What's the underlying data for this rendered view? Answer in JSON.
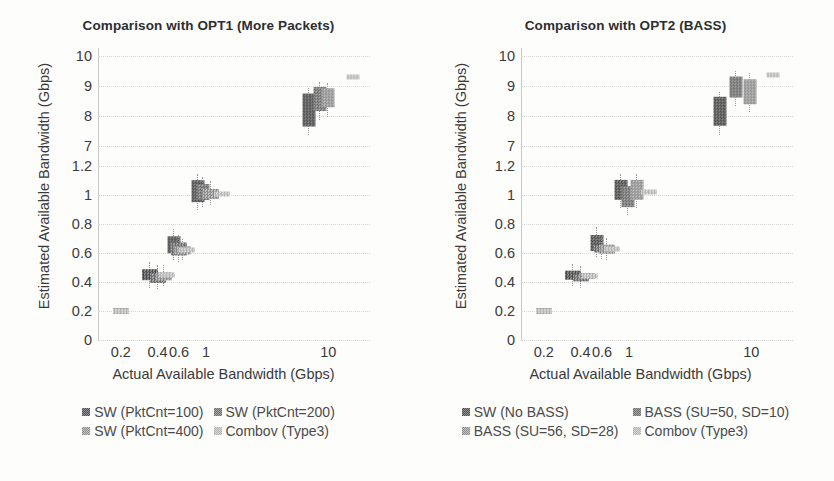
{
  "figure": {
    "background": "#fdfdfc",
    "axis_color": "#c9c9c9",
    "text_color": "#3a3a3a"
  },
  "chart_data": [
    {
      "id": "left",
      "type": "scatter",
      "title": "Comparison with OPT1 (More Packets)",
      "xlabel": "Actual Available Bandwidth (Gbps)",
      "ylabel": "Estimated Available Bandwidth (Gbps)",
      "x_scale": "log",
      "xticks": [
        "0.2",
        "0.4",
        "0.6",
        "1",
        "10"
      ],
      "xtick_values": [
        0.2,
        0.4,
        0.6,
        1,
        10
      ],
      "yticks": [
        "0",
        "0.2",
        "0.4",
        "0.6",
        "0.8",
        "1",
        "1.2",
        "7",
        "8",
        "9",
        "10"
      ],
      "ytick_values": [
        0,
        0.2,
        0.4,
        0.6,
        0.8,
        1,
        1.2,
        7,
        8,
        9,
        10
      ],
      "y_axis_break": "between 1.2 and 7",
      "grid": true,
      "legend_position": "bottom",
      "series": [
        {
          "name": "SW (PktCnt=100)",
          "color": "#4a4a4a",
          "x": [
            0.2,
            0.35,
            0.55,
            0.85,
            7.0
          ],
          "y": [
            0.2,
            0.45,
            0.66,
            1.03,
            8.2
          ],
          "y_low": [
            0.2,
            0.41,
            0.6,
            0.95,
            7.6
          ],
          "y_high": [
            0.2,
            0.49,
            0.72,
            1.1,
            8.7
          ]
        },
        {
          "name": "SW (PktCnt=200)",
          "color": "#6a6a6a",
          "x": [
            0.2,
            0.4,
            0.6,
            0.95,
            8.5
          ],
          "y": [
            0.2,
            0.43,
            0.63,
            1.02,
            8.55
          ],
          "y_low": [
            0.2,
            0.4,
            0.59,
            0.97,
            8.1
          ],
          "y_high": [
            0.2,
            0.47,
            0.68,
            1.08,
            8.9
          ]
        },
        {
          "name": "SW (PktCnt=400)",
          "color": "#8c8c8c",
          "x": [
            0.2,
            0.45,
            0.65,
            1.1,
            10.0
          ],
          "y": [
            0.2,
            0.44,
            0.62,
            1.01,
            8.6
          ],
          "y_low": [
            0.2,
            0.42,
            0.6,
            0.98,
            8.2
          ],
          "y_high": [
            0.2,
            0.47,
            0.65,
            1.05,
            8.85
          ]
        },
        {
          "name": "Combov (Type3)",
          "color": "#b4b4b4",
          "x": [
            0.2,
            0.48,
            0.7,
            1.35,
            16.0
          ],
          "y": [
            0.2,
            0.45,
            0.62,
            1.01,
            9.3
          ],
          "y_low": [
            0.2,
            0.44,
            0.61,
            1.0,
            9.25
          ],
          "y_high": [
            0.2,
            0.46,
            0.63,
            1.02,
            9.35
          ]
        }
      ]
    },
    {
      "id": "right",
      "type": "scatter",
      "title": "Comparison with OPT2 (BASS)",
      "xlabel": "Actual Available Bandwidth (Gbps)",
      "ylabel": "Estimated Available Bandwidth (Gbps)",
      "x_scale": "log",
      "xticks": [
        "0.2",
        "0.4",
        "0.6",
        "1",
        "10"
      ],
      "xtick_values": [
        0.2,
        0.4,
        0.6,
        1,
        10
      ],
      "yticks": [
        "0",
        "0.2",
        "0.4",
        "0.6",
        "0.8",
        "1",
        "1.2",
        "7",
        "8",
        "9",
        "10"
      ],
      "ytick_values": [
        0,
        0.2,
        0.4,
        0.6,
        0.8,
        1,
        1.2,
        7,
        8,
        9,
        10
      ],
      "y_axis_break": "between 1.2 and 7",
      "grid": true,
      "legend_position": "bottom",
      "series": [
        {
          "name": "SW (No BASS)",
          "color": "#4a4a4a",
          "x": [
            0.2,
            0.35,
            0.55,
            0.85,
            5.5
          ],
          "y": [
            0.2,
            0.45,
            0.67,
            1.04,
            8.15
          ],
          "y_low": [
            0.2,
            0.42,
            0.62,
            0.96,
            7.6
          ],
          "y_high": [
            0.2,
            0.48,
            0.73,
            1.1,
            8.55
          ]
        },
        {
          "name": "BASS (SU=50, SD=10)",
          "color": "#6a6a6a",
          "x": [
            0.2,
            0.4,
            0.6,
            0.98,
            7.5
          ],
          "y": [
            0.2,
            0.43,
            0.63,
            0.99,
            8.95
          ],
          "y_low": [
            0.2,
            0.41,
            0.61,
            0.91,
            8.55
          ],
          "y_high": [
            0.2,
            0.46,
            0.66,
            1.06,
            9.25
          ]
        },
        {
          "name": "BASS (SU=56, SD=28)",
          "color": "#8c8c8c",
          "x": [
            0.2,
            0.45,
            0.66,
            1.15,
            9.8
          ],
          "y": [
            0.2,
            0.44,
            0.63,
            1.04,
            8.8
          ],
          "y_low": [
            0.2,
            0.42,
            0.6,
            0.96,
            8.35
          ],
          "y_high": [
            0.2,
            0.46,
            0.66,
            1.1,
            9.2
          ]
        },
        {
          "name": "Combov (Type3)",
          "color": "#b4b4b4",
          "x": [
            0.2,
            0.48,
            0.72,
            1.45,
            15.0
          ],
          "y": [
            0.2,
            0.44,
            0.63,
            1.02,
            9.35
          ],
          "y_low": [
            0.2,
            0.43,
            0.62,
            1.01,
            9.3
          ],
          "y_high": [
            0.2,
            0.45,
            0.64,
            1.03,
            9.4
          ]
        }
      ]
    }
  ],
  "left_panel": {
    "title": "Comparison with OPT1 (More Packets)",
    "ylabel": "Estimated Available Bandwidth (Gbps)",
    "xlabel": "Actual Available Bandwidth (Gbps)",
    "legend": [
      "SW (PktCnt=100)",
      "SW (PktCnt=200)",
      "SW (PktCnt=400)",
      "Combov (Type3)"
    ]
  },
  "right_panel": {
    "title": "Comparison with OPT2 (BASS)",
    "ylabel": "Estimated Available Bandwidth (Gbps)",
    "xlabel": "Actual Available Bandwidth (Gbps)",
    "legend": [
      "SW (No BASS)",
      "BASS (SU=50, SD=10)",
      "BASS (SU=56, SD=28)",
      "Combov (Type3)"
    ]
  }
}
